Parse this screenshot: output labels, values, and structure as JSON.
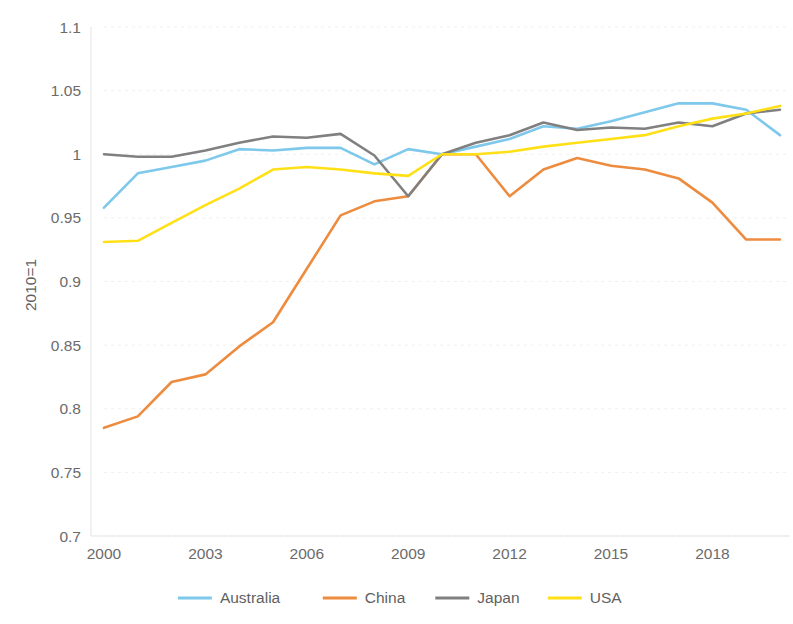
{
  "chart_data": {
    "type": "line",
    "title": "",
    "subtitle": "",
    "xlabel": "",
    "ylabel": "2010=1",
    "xlim": [
      2000,
      2020
    ],
    "ylim": [
      0.7,
      1.1
    ],
    "grid": true,
    "legend_position": "bottom",
    "x_tick_labels": [
      "2000",
      "2003",
      "2006",
      "2009",
      "2012",
      "2015",
      "2018"
    ],
    "x_tick_values": [
      2000,
      2003,
      2006,
      2009,
      2012,
      2015,
      2018
    ],
    "y_tick_labels": [
      "0.7",
      "0.75",
      "0.8",
      "0.85",
      "0.9",
      "0.95",
      "1",
      "1.05",
      "1.1"
    ],
    "y_tick_values": [
      0.7,
      0.75,
      0.8,
      0.85,
      0.9,
      0.95,
      1.0,
      1.05,
      1.1
    ],
    "x": [
      2000,
      2001,
      2002,
      2003,
      2004,
      2005,
      2006,
      2007,
      2008,
      2009,
      2010,
      2011,
      2012,
      2013,
      2014,
      2015,
      2016,
      2017,
      2018,
      2019,
      2020
    ],
    "series": [
      {
        "name": "Australia",
        "color": "#7EC8EC",
        "values": [
          0.958,
          0.985,
          0.99,
          0.995,
          1.004,
          1.003,
          1.005,
          1.005,
          0.992,
          1.004,
          1.0,
          1.006,
          1.012,
          1.022,
          1.02,
          1.026,
          1.033,
          1.04,
          1.04,
          1.035,
          1.015
        ]
      },
      {
        "name": "China",
        "color": "#ED8B3E",
        "values": [
          0.785,
          0.794,
          0.821,
          0.827,
          0.849,
          0.868,
          0.91,
          0.952,
          0.963,
          0.967,
          1.0,
          1.0,
          0.967,
          0.988,
          0.997,
          0.991,
          0.988,
          0.981,
          0.962,
          0.933,
          0.933
        ]
      },
      {
        "name": "Japan",
        "color": "#808080",
        "values": [
          1.0,
          0.998,
          0.998,
          1.003,
          1.009,
          1.014,
          1.013,
          1.016,
          0.999,
          0.967,
          1.0,
          1.009,
          1.015,
          1.025,
          1.019,
          1.021,
          1.02,
          1.025,
          1.022,
          1.032,
          1.035
        ]
      },
      {
        "name": "USA",
        "color": "#FFE017",
        "values": [
          0.931,
          0.932,
          0.946,
          0.96,
          0.973,
          0.988,
          0.99,
          0.988,
          0.985,
          0.983,
          1.0,
          1.0,
          1.002,
          1.006,
          1.009,
          1.012,
          1.015,
          1.022,
          1.028,
          1.032,
          1.038
        ]
      }
    ]
  },
  "legend": {
    "items": [
      {
        "label": "Australia",
        "color": "#7EC8EC"
      },
      {
        "label": "China",
        "color": "#ED8B3E"
      },
      {
        "label": "Japan",
        "color": "#808080"
      },
      {
        "label": "USA",
        "color": "#FFE017"
      }
    ]
  },
  "axis": {
    "y_title": "2010=1"
  }
}
